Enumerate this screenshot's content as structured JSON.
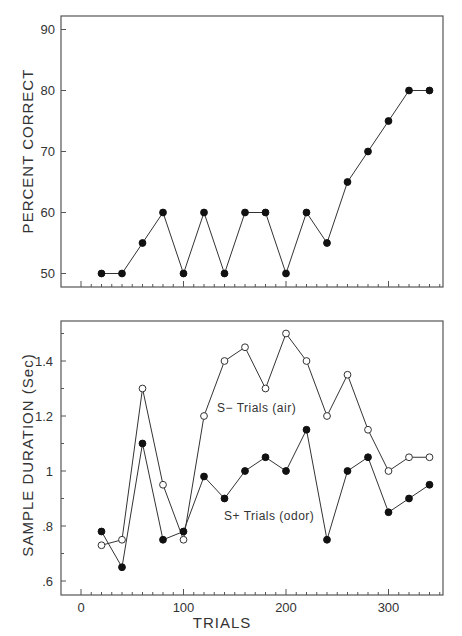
{
  "chart_data": [
    {
      "type": "line",
      "title": "",
      "xlabel": "",
      "ylabel": "PERCENT CORRECT",
      "ylim": [
        47.8,
        92.2
      ],
      "yticks": [
        50,
        60,
        70,
        80,
        90
      ],
      "xlim": [
        -19.5,
        352
      ],
      "xticks_minor_step": 10,
      "xticks_major": [
        0,
        100,
        200,
        300
      ],
      "x_tick_labels_shown": false,
      "grid": false,
      "x": [
        20,
        40,
        60,
        80,
        100,
        120,
        140,
        160,
        180,
        200,
        220,
        240,
        260,
        280,
        300,
        320,
        340
      ],
      "series": [
        {
          "name": "Percent correct",
          "marker": "filled",
          "values": [
            50,
            50,
            55,
            60,
            50,
            60,
            50,
            60,
            60,
            50,
            60,
            55,
            65,
            70,
            75,
            80,
            80
          ]
        }
      ]
    },
    {
      "type": "line",
      "title": "",
      "xlabel": "TRIALS",
      "ylabel": "SAMPLE DURATION (Sec)",
      "ylim": [
        0.55,
        1.55
      ],
      "yticks": [
        0.6,
        0.8,
        1.0,
        1.2,
        1.4
      ],
      "ytick_labels": [
        ".6",
        ".8",
        "1",
        "1.2",
        "1.4"
      ],
      "yticks_minor": [
        0.7,
        0.9,
        1.1,
        1.3,
        1.5
      ],
      "xlim": [
        -19.5,
        352
      ],
      "xticks": [
        0,
        100,
        200,
        300
      ],
      "xtick_labels": [
        "0",
        "100",
        "200",
        "300"
      ],
      "xticks_minor_step": 10,
      "grid": false,
      "legend": "inline annotations",
      "x": [
        20,
        40,
        60,
        80,
        100,
        120,
        140,
        160,
        180,
        200,
        220,
        240,
        260,
        280,
        300,
        320,
        340
      ],
      "series": [
        {
          "name": "S− Trials (air)",
          "marker": "open",
          "values": [
            0.73,
            0.75,
            1.3,
            0.95,
            0.75,
            1.2,
            1.4,
            1.45,
            1.3,
            1.5,
            1.4,
            1.2,
            1.35,
            1.15,
            1.0,
            1.05,
            1.05
          ]
        },
        {
          "name": "S+ Trials (odor)",
          "marker": "filled",
          "values": [
            0.78,
            0.65,
            1.1,
            0.75,
            0.78,
            0.98,
            0.9,
            1.0,
            1.05,
            1.0,
            1.15,
            0.75,
            1.0,
            1.05,
            0.85,
            0.9,
            0.95
          ]
        }
      ],
      "annotations": [
        {
          "text": "S− Trials (air)",
          "x": 133,
          "y": 1.17
        },
        {
          "text": "S+ Trials (odor)",
          "x": 140,
          "y": 0.78
        }
      ]
    }
  ],
  "labels": {
    "top_ylabel": "PERCENT CORRECT",
    "bottom_ylabel": "SAMPLE DURATION (Sec)",
    "bottom_xlabel": "TRIALS",
    "annot_air": "S− Trials (air)",
    "annot_odor": "S+ Trials (odor)"
  }
}
